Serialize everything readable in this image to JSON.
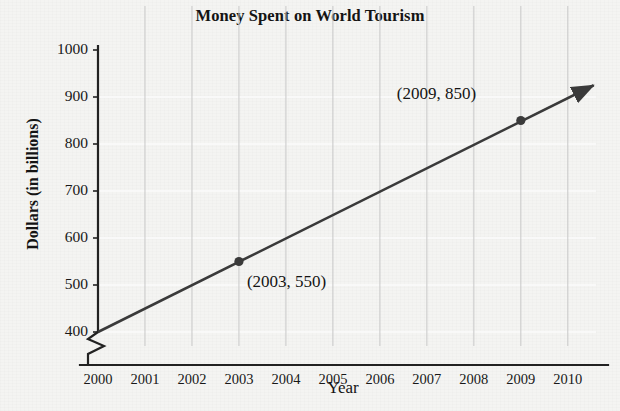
{
  "chart_data": {
    "type": "line",
    "title": "Money Spent on World Tourism",
    "xlabel": "Year",
    "ylabel": "Dollars (in billions)",
    "x": [
      2000,
      2001,
      2002,
      2003,
      2004,
      2005,
      2006,
      2007,
      2008,
      2009,
      2010
    ],
    "xtick_labels": [
      "2000",
      "2001",
      "2002",
      "2003",
      "2004",
      "2005",
      "2006",
      "2007",
      "2008",
      "2009",
      "2010"
    ],
    "ytick_labels": [
      "400",
      "500",
      "600",
      "700",
      "800",
      "900",
      "1000"
    ],
    "ytick_values": [
      400,
      500,
      600,
      700,
      800,
      900,
      1000
    ],
    "xlim": [
      2000,
      2010.6
    ],
    "ylim": [
      400,
      1000
    ],
    "y_axis_break": true,
    "y_axis_break_note": "zigzag break between 0 and 400",
    "grid": "vertical gridlines at each year; faint white horizontal gridlines at each 100",
    "legend": "none",
    "series": [
      {
        "name": "Money spent on world tourism",
        "line_kind": "trend line with arrowhead",
        "endpoints": [
          {
            "x": 2000,
            "y": 400
          },
          {
            "x": 2010.55,
            "y": 925
          }
        ],
        "slope_per_year": 50,
        "marked_points": [
          {
            "x": 2003,
            "y": 550,
            "label": "(2003, 550)"
          },
          {
            "x": 2009,
            "y": 850,
            "label": "(2009, 850)"
          }
        ]
      }
    ],
    "annotations": [
      {
        "text": "(2003, 550)",
        "anchor_x": 2003,
        "anchor_y": 550
      },
      {
        "text": "(2009, 850)",
        "anchor_x": 2009,
        "anchor_y": 850
      }
    ],
    "colors": {
      "background": "#f4f4f2",
      "line": "#3a3a3a",
      "marker": "#3a3a3a",
      "axis": "#222222",
      "vertical_gridline": "#c8c8c8",
      "horizontal_gridline": "#fbfbfb",
      "text": "#141414"
    }
  }
}
